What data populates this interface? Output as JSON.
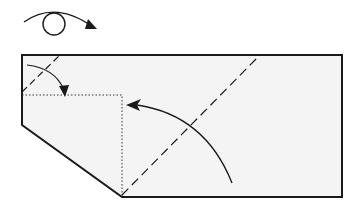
{
  "diagram": {
    "type": "origami-fold-step",
    "symbols": [
      {
        "name": "turn-over",
        "meaning": "Turn the model over"
      },
      {
        "name": "valley-fold-corner",
        "meaning": "Valley fold the top-left corner down to the dotted line"
      },
      {
        "name": "valley-fold-diagonal",
        "meaning": "Valley fold the right portion along the diagonal dashed line up to the left"
      }
    ],
    "colors": {
      "paper": "#f4f4f4",
      "line": "#1a1a1a",
      "background": "#ffffff"
    },
    "line_styles": {
      "edge": "solid",
      "valley_fold": "dashed",
      "reference": "dotted"
    }
  }
}
